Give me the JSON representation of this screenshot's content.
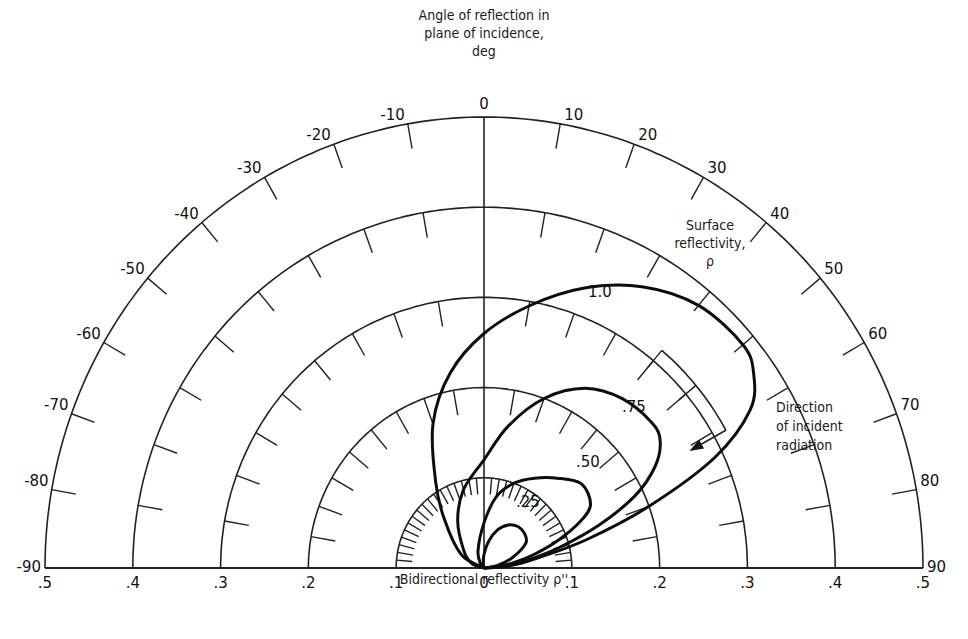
{
  "chart_data": {
    "type": "polar",
    "title": "Angle of reflection in plane of incidence, deg",
    "title_lines": [
      "Angle of reflection in",
      "plane of incidence,",
      "deg"
    ],
    "xlabel": "Bidirectional reflectivity ρ''",
    "radial_ticks": [
      ".5",
      ".4",
      ".3",
      ".2",
      ".1",
      "0",
      ".1",
      ".2",
      ".3",
      ".4",
      ".5"
    ],
    "radial_values": [
      0.1,
      0.2,
      0.3,
      0.4,
      0.5
    ],
    "rlim": [
      0,
      0.5
    ],
    "angular_ticks": [
      -90,
      -80,
      -70,
      -60,
      -50,
      -40,
      -30,
      -20,
      -10,
      0,
      10,
      20,
      30,
      40,
      50,
      60,
      70,
      80,
      90
    ],
    "angular_labels": [
      "-90",
      "-80",
      "-70",
      "-60",
      "-50",
      "-40",
      "-30",
      "-20",
      "-10",
      "0",
      "10",
      "20",
      "30",
      "40",
      "50",
      "60",
      "70",
      "80",
      "90"
    ],
    "legend_title": [
      "Surface",
      "reflectivity,",
      "ρ"
    ],
    "incident_direction_deg": 60,
    "incident_label": [
      "Direction",
      "of incident",
      "radiation"
    ],
    "series": [
      {
        "name": "1.0",
        "label": "1.0",
        "points": [
          [
            -90,
            0
          ],
          [
            -60,
            0.03
          ],
          [
            -40,
            0.07
          ],
          [
            -30,
            0.11
          ],
          [
            -20,
            0.17
          ],
          [
            -10,
            0.22
          ],
          [
            0,
            0.26
          ],
          [
            10,
            0.295
          ],
          [
            20,
            0.33
          ],
          [
            30,
            0.36
          ],
          [
            40,
            0.38
          ],
          [
            50,
            0.385
          ],
          [
            55,
            0.375
          ],
          [
            60,
            0.35
          ],
          [
            65,
            0.29
          ],
          [
            70,
            0.2
          ],
          [
            75,
            0.12
          ],
          [
            80,
            0.06
          ],
          [
            85,
            0.03
          ],
          [
            90,
            0
          ]
        ]
      },
      {
        "name": "0.75",
        "label": ".75",
        "points": [
          [
            -90,
            0
          ],
          [
            -70,
            0.015
          ],
          [
            -50,
            0.03
          ],
          [
            -30,
            0.06
          ],
          [
            -15,
            0.09
          ],
          [
            0,
            0.12
          ],
          [
            10,
            0.16
          ],
          [
            20,
            0.2
          ],
          [
            30,
            0.23
          ],
          [
            40,
            0.245
          ],
          [
            50,
            0.25
          ],
          [
            55,
            0.245
          ],
          [
            60,
            0.225
          ],
          [
            65,
            0.19
          ],
          [
            70,
            0.14
          ],
          [
            75,
            0.09
          ],
          [
            80,
            0.05
          ],
          [
            85,
            0.02
          ],
          [
            90,
            0
          ]
        ]
      },
      {
        "name": "0.50",
        "label": ".50",
        "points": [
          [
            -90,
            0
          ],
          [
            -45,
            0.005
          ],
          [
            -20,
            0.02
          ],
          [
            0,
            0.05
          ],
          [
            10,
            0.08
          ],
          [
            20,
            0.1
          ],
          [
            30,
            0.115
          ],
          [
            40,
            0.13
          ],
          [
            50,
            0.145
          ],
          [
            60,
            0.14
          ],
          [
            65,
            0.12
          ],
          [
            70,
            0.09
          ],
          [
            75,
            0.06
          ],
          [
            80,
            0.035
          ],
          [
            85,
            0.015
          ],
          [
            90,
            0
          ]
        ]
      },
      {
        "name": "0.25",
        "label": ".25",
        "points": [
          [
            -90,
            0
          ],
          [
            -10,
            0.005
          ],
          [
            0,
            0.015
          ],
          [
            10,
            0.03
          ],
          [
            20,
            0.045
          ],
          [
            30,
            0.055
          ],
          [
            40,
            0.06
          ],
          [
            50,
            0.06
          ],
          [
            60,
            0.055
          ],
          [
            70,
            0.035
          ],
          [
            80,
            0.015
          ],
          [
            90,
            0
          ]
        ]
      }
    ],
    "grid": true
  },
  "labels": {
    "xlabel": "Bidirectional reflectivity ρ''",
    "legend_title_1": "Surface",
    "legend_title_2": "reflectivity,",
    "legend_title_3": "ρ",
    "incident_1": "Direction",
    "incident_2": "of incident",
    "incident_3": "radiation",
    "title_1": "Angle of reflection in",
    "title_2": "plane of incidence,",
    "title_3": "deg"
  }
}
